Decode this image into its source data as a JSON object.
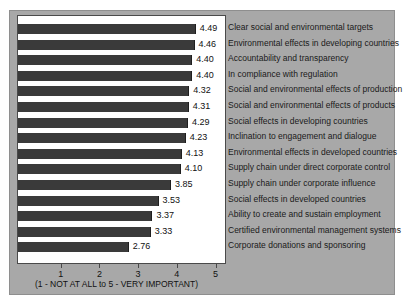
{
  "chart_data": {
    "type": "bar",
    "orientation": "horizontal",
    "title": "",
    "xlabel": "(1 - NOT AT ALL to 5 - VERY IMPORTANT)",
    "ylabel": "",
    "xlim": [
      0,
      5
    ],
    "grid": false,
    "legend": "none",
    "xticks": [
      1,
      2,
      3,
      4,
      5
    ],
    "xtick_labels": [
      "1",
      "2",
      "3",
      "4",
      "5"
    ],
    "categories": [
      "Clear social and environmental targets",
      "Environmental effects in developing countries",
      "Accountability and transparency",
      "In compliance with regulation",
      "Social and environmental effects of production",
      "Social and environmental effects of products",
      "Social effects in developing countries",
      "Inclination to engagement and dialogue",
      "Environmental effects in developed countries",
      "Supply chain under direct corporate control",
      "Supply chain under corporate influence",
      "Social effects in developed countries",
      "Ability to create and sustain employment",
      "Certified environmental management systems",
      "Corporate donations and sponsoring"
    ],
    "values": [
      4.49,
      4.46,
      4.4,
      4.4,
      4.32,
      4.31,
      4.29,
      4.23,
      4.13,
      4.1,
      3.85,
      3.53,
      3.37,
      3.33,
      2.76
    ],
    "value_labels": [
      "4.49",
      "4.46",
      "4.40",
      "4.40",
      "4.32",
      "4.31",
      "4.29",
      "4.23",
      "4.13",
      "4.10",
      "3.85",
      "3.53",
      "3.37",
      "3.33",
      "2.76"
    ],
    "colors": {
      "bar": "#3a3a3a",
      "figure_background": "#a8a8a8",
      "plot_background": "#ffffff",
      "text": "#111111",
      "axis": "#4a4a4a"
    }
  }
}
